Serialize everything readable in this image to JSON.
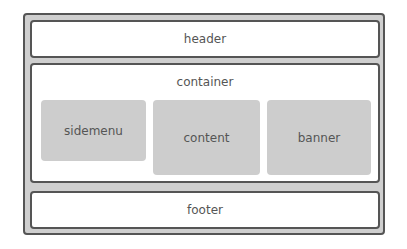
{
  "diagram": {
    "header": "header",
    "container": "container",
    "sidemenu": "sidemenu",
    "content": "content",
    "banner": "banner",
    "footer": "footer"
  },
  "colors": {
    "border": "#555555",
    "outer_fill": "#cfcfcf",
    "block_fill": "#cdcdcd",
    "white": "#ffffff"
  }
}
